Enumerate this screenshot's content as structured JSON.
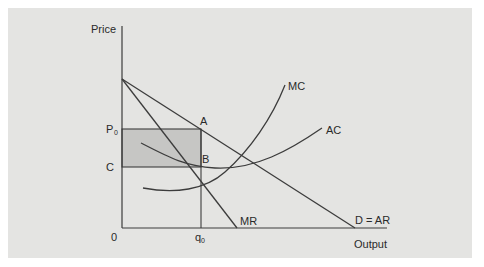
{
  "diagram": {
    "type": "monopoly-equilibrium",
    "axes": {
      "y_label": "Price",
      "x_label": "Output",
      "origin_label": "0"
    },
    "price_labels": {
      "p0_main": "P",
      "p0_sub": "0",
      "c": "C"
    },
    "quantity_labels": {
      "q0_main": "q",
      "q0_sub": "0"
    },
    "points": {
      "a": "A",
      "b": "B"
    },
    "curves": {
      "mc": "MC",
      "ac": "AC",
      "mr": "MR",
      "demand": "D = AR"
    },
    "shaded_region": "supernormal-profit",
    "colors": {
      "background": "#e4e4e2",
      "shade": "#c6c6c4",
      "line": "#3c3c3c"
    }
  }
}
